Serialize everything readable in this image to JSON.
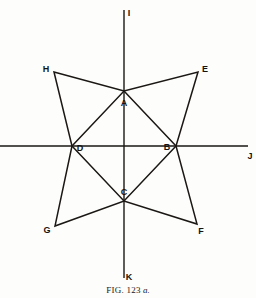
{
  "figure": {
    "caption_prefix": "FIG.",
    "caption_number": "123",
    "caption_suffix": "a.",
    "line_color": "#1a1714",
    "background_color": "#fdfdfb"
  },
  "vertices": [
    {
      "id": "A",
      "label": "A",
      "x": 124,
      "y": 91,
      "label_x": 124,
      "label_y": 103
    },
    {
      "id": "B",
      "label": "B",
      "x": 176,
      "y": 146,
      "label_x": 167,
      "label_y": 147
    },
    {
      "id": "C",
      "label": "C",
      "x": 124,
      "y": 201,
      "label_x": 124,
      "label_y": 192
    },
    {
      "id": "D",
      "label": "D",
      "x": 72,
      "y": 146,
      "label_x": 80,
      "label_y": 148
    },
    {
      "id": "E",
      "label": "E",
      "x": 198,
      "y": 72,
      "label_x": 205,
      "label_y": 69
    },
    {
      "id": "F",
      "label": "F",
      "x": 197,
      "y": 224,
      "label_x": 201,
      "label_y": 231
    },
    {
      "id": "G",
      "label": "G",
      "x": 55,
      "y": 226,
      "label_x": 47,
      "label_y": 230
    },
    {
      "id": "H",
      "label": "H",
      "x": 54,
      "y": 72,
      "label_x": 46,
      "label_y": 69
    }
  ],
  "star_outline": {
    "name": "star-outline-path",
    "points": "54,72 124,91 198,72 176,146 197,224 124,201 55,226 72,146",
    "closed": true
  },
  "inner_quadrilateral": {
    "name": "inner-diamond-ABCD",
    "points": "124,91 176,146 124,201 72,146",
    "closed": true
  },
  "axes": [
    {
      "id": "vertical",
      "label_top": "I",
      "label_bottom": "K",
      "x1": 124,
      "y1": 10,
      "x2": 124,
      "y2": 278,
      "label_top_x": 129,
      "label_top_y": 13,
      "label_bottom_x": 129,
      "label_bottom_y": 277
    },
    {
      "id": "horizontal",
      "label_right": "J",
      "x1": 0,
      "y1": 146,
      "x2": 248,
      "y2": 146,
      "label_right_x": 250,
      "label_right_y": 156
    }
  ],
  "caption_position": {
    "x": 124,
    "y": 291
  }
}
